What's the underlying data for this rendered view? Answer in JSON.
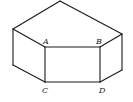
{
  "diagram": {
    "type": "3d-solid-pentagonal-prism",
    "vertices": {
      "top_apex": [
        60,
        0
      ],
      "left_top": [
        13,
        29
      ],
      "A": [
        45,
        47
      ],
      "B": [
        100,
        47
      ],
      "right_top": [
        122,
        34
      ],
      "left_bottom": [
        13,
        65
      ],
      "C": [
        45,
        82
      ],
      "D": [
        100,
        82
      ],
      "right_bottom": [
        122,
        70
      ]
    },
    "labels": [
      {
        "id": "A",
        "text": "A",
        "x": 44,
        "y": 44
      },
      {
        "id": "B",
        "text": "B",
        "x": 97,
        "y": 44
      },
      {
        "id": "C",
        "text": "C",
        "x": 42,
        "y": 93
      },
      {
        "id": "D",
        "text": "D",
        "x": 100,
        "y": 93
      }
    ],
    "edges": [
      [
        "top_apex",
        "left_top"
      ],
      [
        "top_apex",
        "right_top"
      ],
      [
        "left_top",
        "A"
      ],
      [
        "A",
        "B"
      ],
      [
        "B",
        "right_top"
      ],
      [
        "left_top",
        "left_bottom"
      ],
      [
        "A",
        "C"
      ],
      [
        "B",
        "D"
      ],
      [
        "right_top",
        "right_bottom"
      ],
      [
        "left_bottom",
        "C"
      ],
      [
        "C",
        "D"
      ],
      [
        "D",
        "right_bottom"
      ]
    ],
    "colors": {
      "stroke": "#1a1a1a",
      "label": "#222222",
      "background": "#ffffff"
    }
  }
}
